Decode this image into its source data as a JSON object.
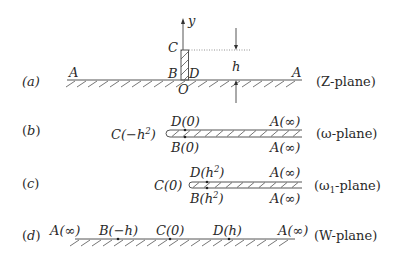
{
  "panels": [
    {
      "id": "a",
      "tag": "(a)",
      "plane_prefix": "(Z-plane)",
      "points": {
        "A_left": "A",
        "A_right": "A",
        "B": "B",
        "D": "D",
        "C": "C",
        "O": "O",
        "axis": "y",
        "height": "h"
      }
    },
    {
      "id": "b",
      "tag": "(b)",
      "plane_label": "(ω-plane)",
      "points": {
        "C": "C(−h",
        "C_exp": "2",
        "C_close": ")",
        "D": "D(0)",
        "B": "B(0)",
        "A_top": "A(∞)",
        "A_bottom": "A(∞)"
      }
    },
    {
      "id": "c",
      "tag": "(c)",
      "plane_main": "(ω",
      "plane_sub": "1",
      "plane_rest": "-plane)",
      "points": {
        "C": "C(0)",
        "D": "D(h",
        "D_exp": "2",
        "D_close": ")",
        "B": "B(h",
        "B_exp": "2",
        "B_close": ")",
        "A_top": "A(∞)",
        "A_bottom": "A(∞)"
      }
    },
    {
      "id": "d",
      "tag": "(d)",
      "plane_label": "(W-plane)",
      "points": {
        "A_left": "A(∞)",
        "B": "B(−h)",
        "C": "C(0)",
        "D": "D(h)",
        "A_right": "A(∞)"
      }
    }
  ]
}
